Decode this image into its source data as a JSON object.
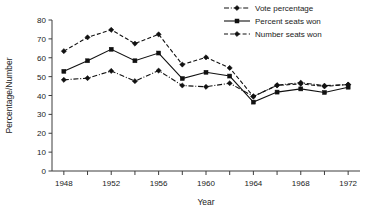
{
  "chart_data": {
    "type": "line",
    "title": "",
    "xlabel": "Year",
    "ylabel": "Percentage/Number",
    "xlim": [
      1947,
      1973
    ],
    "ylim": [
      0,
      80
    ],
    "ytick_step": 10,
    "yticks": [
      0,
      10,
      20,
      30,
      40,
      50,
      60,
      70,
      80
    ],
    "xticks": [
      1948,
      1950,
      1952,
      1954,
      1956,
      1958,
      1960,
      1962,
      1964,
      1966,
      1968,
      1970,
      1972
    ],
    "xtick_labels": [
      "1948",
      "",
      "1952",
      "",
      "1956",
      "",
      "1960",
      "",
      "1964",
      "",
      "1968",
      "",
      "1972"
    ],
    "grid": false,
    "legend_position": "top-right",
    "x": [
      1948,
      1950,
      1952,
      1954,
      1956,
      1958,
      1960,
      1962,
      1964,
      1966,
      1968,
      1970,
      1972
    ],
    "series": [
      {
        "name": "Vote percentage",
        "marker": "plus-diamond",
        "dash": "dash-dot",
        "values": [
          48.3,
          49.2,
          53.0,
          47.6,
          53.2,
          45.3,
          44.6,
          46.5,
          39.5,
          45.5,
          46.8,
          45.2,
          45.8
        ]
      },
      {
        "name": "Percent seats won",
        "marker": "square",
        "dash": "solid",
        "values": [
          52.8,
          58.4,
          64.5,
          58.4,
          62.5,
          49.0,
          52.3,
          50.3,
          36.5,
          41.8,
          43.5,
          41.6,
          44.4
        ]
      },
      {
        "name": "Number seats won",
        "marker": "plus-diamond",
        "dash": "dashed",
        "values": [
          63.5,
          70.8,
          74.8,
          67.5,
          72.4,
          56.4,
          60.2,
          54.6,
          39.5,
          45.3,
          46.2,
          44.8,
          45.8
        ]
      }
    ]
  },
  "axes": {
    "y_title": "Percentage/Number",
    "x_title": "Year",
    "y_tick_labels": [
      "0",
      "10",
      "20",
      "30",
      "40",
      "50",
      "60",
      "70",
      "80"
    ],
    "x_tick_labels": [
      "1948",
      "1952",
      "1956",
      "1960",
      "1964",
      "1968",
      "1972"
    ]
  },
  "legend": {
    "items": [
      {
        "label": "Vote percentage"
      },
      {
        "label": "Percent seats won"
      },
      {
        "label": "Number seats won"
      }
    ]
  },
  "colors": {
    "line": "#111111",
    "axis": "#3d3d3d",
    "background": "#ffffff"
  }
}
